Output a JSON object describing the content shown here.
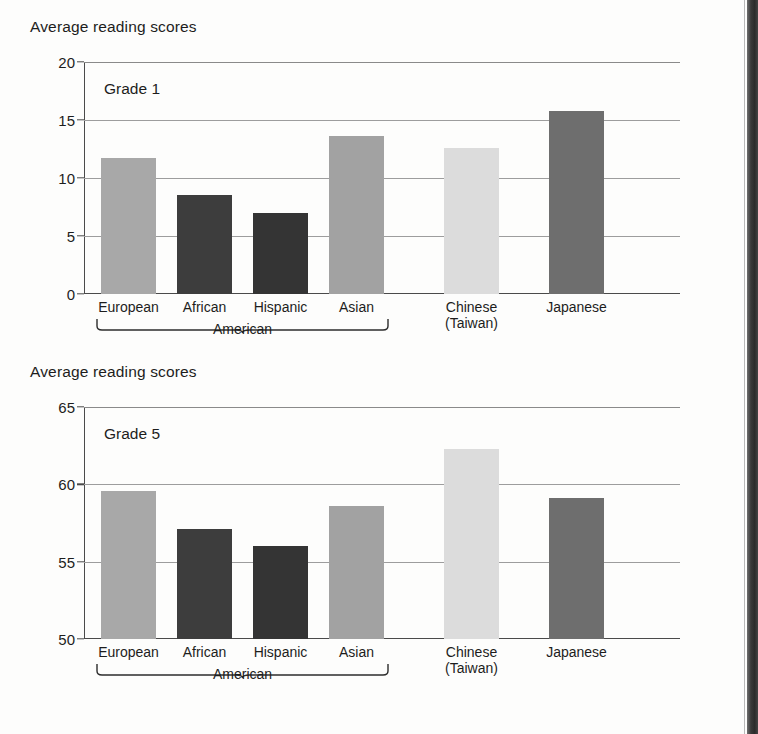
{
  "figure": {
    "background_color": "#fdfdfc",
    "axis_color": "#4a4a4a",
    "gridline_color": "#9d9d9d",
    "text_color": "#1d1d1d"
  },
  "palette": {
    "european": "#a8a8a8",
    "african": "#3d3d3d",
    "hispanic": "#343434",
    "asian": "#a2a2a2",
    "chinese": "#dcdcdc",
    "japanese": "#6e6e6e"
  },
  "chart_data": [
    {
      "type": "bar",
      "title": "Average reading scores",
      "panel_label": "Grade 1",
      "xlabel": "",
      "ylabel": "",
      "ylim": [
        0,
        20
      ],
      "yticks": [
        0,
        5,
        10,
        15,
        20
      ],
      "ytick_labels": [
        "0",
        "5",
        "10",
        "15",
        "20"
      ],
      "grid": true,
      "legend": "none",
      "categories": [
        "European",
        "African",
        "Hispanic",
        "Asian",
        "Chinese\n(Taiwan)",
        "Japanese"
      ],
      "category_labels": [
        {
          "line1": "European",
          "line2": ""
        },
        {
          "line1": "African",
          "line2": ""
        },
        {
          "line1": "Hispanic",
          "line2": ""
        },
        {
          "line1": "Asian",
          "line2": ""
        },
        {
          "line1": "Chinese",
          "line2": "(Taiwan)"
        },
        {
          "line1": "Japanese",
          "line2": ""
        }
      ],
      "values": [
        11.7,
        8.5,
        7.0,
        13.6,
        12.6,
        15.8
      ],
      "bar_colors": [
        "#a8a8a8",
        "#3d3d3d",
        "#343434",
        "#a2a2a2",
        "#dcdcdc",
        "#6e6e6e"
      ],
      "group_brace": {
        "label": "American",
        "covers": [
          "European",
          "African",
          "Hispanic",
          "Asian"
        ]
      }
    },
    {
      "type": "bar",
      "title": "Average reading scores",
      "panel_label": "Grade 5",
      "xlabel": "",
      "ylabel": "",
      "ylim": [
        50,
        65
      ],
      "yticks": [
        50,
        55,
        60,
        65
      ],
      "ytick_labels": [
        "50",
        "55",
        "60",
        "65"
      ],
      "grid": true,
      "legend": "none",
      "categories": [
        "European",
        "African",
        "Hispanic",
        "Asian",
        "Chinese\n(Taiwan)",
        "Japanese"
      ],
      "category_labels": [
        {
          "line1": "European",
          "line2": ""
        },
        {
          "line1": "African",
          "line2": ""
        },
        {
          "line1": "Hispanic",
          "line2": ""
        },
        {
          "line1": "Asian",
          "line2": ""
        },
        {
          "line1": "Chinese",
          "line2": "(Taiwan)"
        },
        {
          "line1": "Japanese",
          "line2": ""
        }
      ],
      "values": [
        59.6,
        57.1,
        56.0,
        58.6,
        62.3,
        59.1
      ],
      "bar_colors": [
        "#a8a8a8",
        "#3d3d3d",
        "#343434",
        "#a2a2a2",
        "#dcdcdc",
        "#6e6e6e"
      ],
      "group_brace": {
        "label": "American",
        "covers": [
          "European",
          "African",
          "Hispanic",
          "Asian"
        ]
      }
    }
  ]
}
